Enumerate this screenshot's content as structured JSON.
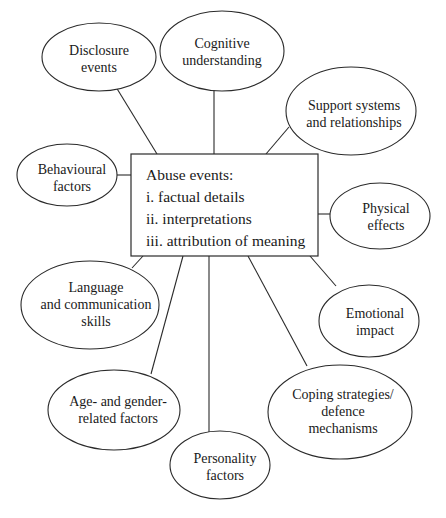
{
  "diagram": {
    "center": {
      "title": "Abuse events:",
      "items": [
        "i. factual details",
        "ii. interpretations",
        "iii. attribution of meaning"
      ]
    },
    "nodes": [
      {
        "id": "disclosure-events",
        "lines": [
          "Disclosure",
          "events"
        ]
      },
      {
        "id": "cognitive-understanding",
        "lines": [
          "Cognitive",
          "understanding"
        ]
      },
      {
        "id": "support-systems",
        "lines": [
          "Support systems",
          "and relationships"
        ]
      },
      {
        "id": "behavioural-factors",
        "lines": [
          "Behavioural",
          "factors"
        ]
      },
      {
        "id": "physical-effects",
        "lines": [
          "Physical",
          "effects"
        ]
      },
      {
        "id": "language-communication",
        "lines": [
          "Language",
          "and communication",
          "skills"
        ]
      },
      {
        "id": "emotional-impact",
        "lines": [
          "Emotional",
          "impact"
        ]
      },
      {
        "id": "age-gender",
        "lines": [
          "Age- and gender-",
          "related factors"
        ]
      },
      {
        "id": "coping-strategies",
        "lines": [
          "Coping strategies/",
          "defence",
          "mechanisms"
        ]
      },
      {
        "id": "personality-factors",
        "lines": [
          "Personality",
          "factors"
        ]
      }
    ]
  }
}
